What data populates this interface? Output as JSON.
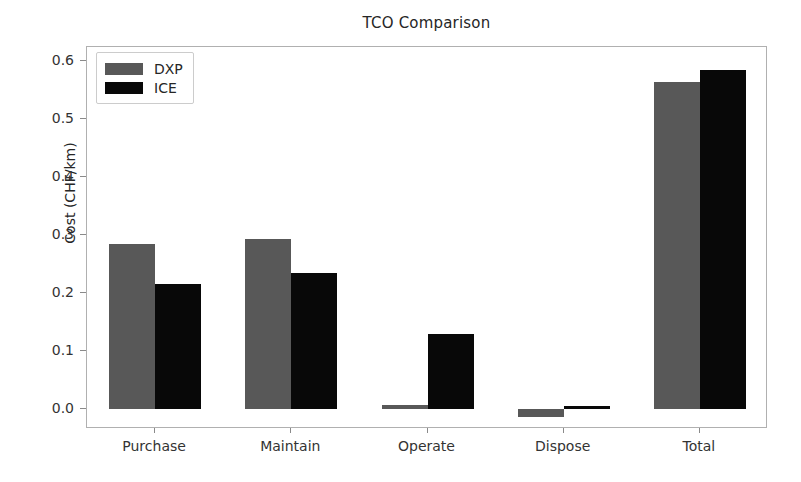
{
  "chart_data": {
    "type": "bar",
    "title": "TCO Comparison",
    "xlabel": "",
    "ylabel": "Cost (CHF/km)",
    "categories": [
      "Purchase",
      "Maintain",
      "Operate",
      "Dispose",
      "Total"
    ],
    "series": [
      {
        "name": "DXP",
        "color": "#585858",
        "values": [
          0.285,
          0.293,
          0.007,
          -0.014,
          0.565
        ]
      },
      {
        "name": "ICE",
        "color": "#080808",
        "values": [
          0.215,
          0.235,
          0.129,
          0.005,
          0.585
        ]
      }
    ],
    "ylim": [
      -0.035,
      0.625
    ],
    "yticks": [
      0.0,
      0.1,
      0.2,
      0.3,
      0.4,
      0.5,
      0.6
    ],
    "ytick_labels": [
      "0.0",
      "0.1",
      "0.2",
      "0.3",
      "0.4",
      "0.5",
      "0.6"
    ],
    "grid": false,
    "legend_position": "upper left",
    "legend_entries": [
      "DXP",
      "ICE"
    ]
  }
}
